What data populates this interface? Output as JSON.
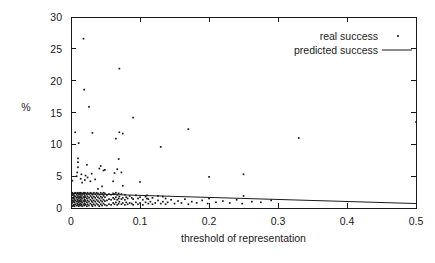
{
  "chart_data": {
    "type": "scatter",
    "title": "",
    "xlabel": "threshold of representation",
    "ylabel": "%",
    "xlim": [
      0,
      0.5
    ],
    "ylim": [
      0,
      30
    ],
    "xticks": [
      0,
      0.1,
      0.2,
      0.3,
      0.4,
      0.5
    ],
    "xtick_labels": [
      "0",
      "0.1",
      "0.2",
      "0.3",
      "0.4",
      "0.5"
    ],
    "yticks": [
      0,
      5,
      10,
      15,
      20,
      25,
      30
    ],
    "ytick_labels": [
      "0",
      "5",
      "10",
      "15",
      "20",
      "25",
      "30"
    ],
    "grid": false,
    "legend_position": "top-right",
    "legend": [
      {
        "label": "real success",
        "marker": "dot"
      },
      {
        "label": "predicted success",
        "marker": "line"
      }
    ],
    "series": [
      {
        "name": "real success",
        "type": "scatter",
        "marker": "dot",
        "color": "#1a1a1a",
        "points": [
          [
            0.002,
            0.3
          ],
          [
            0.002,
            0.8
          ],
          [
            0.002,
            1.2
          ],
          [
            0.002,
            1.6
          ],
          [
            0.002,
            2.0
          ],
          [
            0.002,
            2.4
          ],
          [
            0.002,
            4.3
          ],
          [
            0.003,
            0.4
          ],
          [
            0.003,
            1.0
          ],
          [
            0.003,
            1.5
          ],
          [
            0.003,
            2.1
          ],
          [
            0.004,
            0.5
          ],
          [
            0.004,
            1.1
          ],
          [
            0.004,
            1.7
          ],
          [
            0.004,
            2.2
          ],
          [
            0.005,
            0.3
          ],
          [
            0.005,
            0.9
          ],
          [
            0.005,
            1.4
          ],
          [
            0.005,
            1.9
          ],
          [
            0.005,
            2.3
          ],
          [
            0.006,
            0.6
          ],
          [
            0.006,
            1.2
          ],
          [
            0.006,
            1.8
          ],
          [
            0.006,
            2.4
          ],
          [
            0.006,
            11.9
          ],
          [
            0.008,
            0.4
          ],
          [
            0.008,
            1.0
          ],
          [
            0.008,
            1.6
          ],
          [
            0.008,
            2.2
          ],
          [
            0.008,
            5.0
          ],
          [
            0.009,
            0.7
          ],
          [
            0.009,
            1.3
          ],
          [
            0.009,
            1.9
          ],
          [
            0.009,
            2.4
          ],
          [
            0.009,
            5.6
          ],
          [
            0.01,
            0.5
          ],
          [
            0.01,
            1.1
          ],
          [
            0.01,
            1.7
          ],
          [
            0.01,
            2.3
          ],
          [
            0.01,
            6.4
          ],
          [
            0.01,
            7.2
          ],
          [
            0.01,
            7.8
          ],
          [
            0.011,
            0.3
          ],
          [
            0.011,
            0.9
          ],
          [
            0.011,
            1.5
          ],
          [
            0.011,
            2.1
          ],
          [
            0.011,
            10.2
          ],
          [
            0.012,
            0.6
          ],
          [
            0.012,
            1.2
          ],
          [
            0.012,
            1.8
          ],
          [
            0.012,
            2.4
          ],
          [
            0.013,
            0.4
          ],
          [
            0.013,
            1.0
          ],
          [
            0.013,
            1.6
          ],
          [
            0.013,
            2.2
          ],
          [
            0.014,
            0.7
          ],
          [
            0.014,
            1.3
          ],
          [
            0.014,
            1.9
          ],
          [
            0.014,
            2.4
          ],
          [
            0.014,
            4.6
          ],
          [
            0.015,
            0.5
          ],
          [
            0.015,
            1.1
          ],
          [
            0.015,
            1.7
          ],
          [
            0.015,
            2.3
          ],
          [
            0.015,
            5.3
          ],
          [
            0.016,
            0.3
          ],
          [
            0.016,
            0.9
          ],
          [
            0.016,
            1.5
          ],
          [
            0.016,
            2.1
          ],
          [
            0.016,
            4.0
          ],
          [
            0.018,
            0.6
          ],
          [
            0.018,
            1.2
          ],
          [
            0.018,
            1.8
          ],
          [
            0.018,
            2.4
          ],
          [
            0.018,
            26.6
          ],
          [
            0.019,
            0.4
          ],
          [
            0.019,
            1.0
          ],
          [
            0.019,
            1.6
          ],
          [
            0.019,
            2.2
          ],
          [
            0.019,
            18.6
          ],
          [
            0.02,
            0.7
          ],
          [
            0.02,
            1.3
          ],
          [
            0.02,
            1.9
          ],
          [
            0.02,
            2.4
          ],
          [
            0.02,
            4.4
          ],
          [
            0.021,
            0.5
          ],
          [
            0.021,
            1.1
          ],
          [
            0.021,
            1.7
          ],
          [
            0.021,
            2.3
          ],
          [
            0.021,
            5.1
          ],
          [
            0.023,
            0.3
          ],
          [
            0.023,
            0.9
          ],
          [
            0.023,
            1.5
          ],
          [
            0.023,
            2.1
          ],
          [
            0.023,
            6.8
          ],
          [
            0.024,
            0.6
          ],
          [
            0.024,
            1.2
          ],
          [
            0.024,
            1.8
          ],
          [
            0.024,
            2.4
          ],
          [
            0.024,
            4.8
          ],
          [
            0.026,
            0.4
          ],
          [
            0.026,
            1.0
          ],
          [
            0.026,
            1.6
          ],
          [
            0.026,
            2.2
          ],
          [
            0.026,
            15.9
          ],
          [
            0.028,
            0.7
          ],
          [
            0.028,
            1.3
          ],
          [
            0.028,
            1.9
          ],
          [
            0.028,
            2.4
          ],
          [
            0.028,
            4.2
          ],
          [
            0.03,
            0.5
          ],
          [
            0.03,
            1.1
          ],
          [
            0.03,
            1.7
          ],
          [
            0.03,
            2.3
          ],
          [
            0.03,
            5.4
          ],
          [
            0.031,
            0.3
          ],
          [
            0.031,
            0.9
          ],
          [
            0.031,
            1.5
          ],
          [
            0.031,
            2.1
          ],
          [
            0.031,
            11.8
          ],
          [
            0.033,
            0.6
          ],
          [
            0.033,
            1.2
          ],
          [
            0.033,
            1.8
          ],
          [
            0.033,
            2.4
          ],
          [
            0.035,
            0.4
          ],
          [
            0.035,
            1.0
          ],
          [
            0.035,
            1.6
          ],
          [
            0.035,
            2.2
          ],
          [
            0.035,
            4.5
          ],
          [
            0.037,
            0.7
          ],
          [
            0.037,
            1.3
          ],
          [
            0.037,
            1.9
          ],
          [
            0.037,
            2.4
          ],
          [
            0.039,
            0.5
          ],
          [
            0.039,
            1.1
          ],
          [
            0.039,
            1.7
          ],
          [
            0.039,
            2.3
          ],
          [
            0.039,
            3.0
          ],
          [
            0.041,
            0.3
          ],
          [
            0.041,
            0.9
          ],
          [
            0.041,
            1.5
          ],
          [
            0.041,
            2.1
          ],
          [
            0.041,
            6.2
          ],
          [
            0.043,
            0.6
          ],
          [
            0.043,
            1.2
          ],
          [
            0.043,
            1.8
          ],
          [
            0.043,
            2.4
          ],
          [
            0.043,
            6.6
          ],
          [
            0.045,
            0.4
          ],
          [
            0.045,
            1.0
          ],
          [
            0.045,
            1.6
          ],
          [
            0.045,
            2.2
          ],
          [
            0.045,
            3.4
          ],
          [
            0.047,
            0.7
          ],
          [
            0.047,
            1.3
          ],
          [
            0.047,
            1.9
          ],
          [
            0.047,
            2.4
          ],
          [
            0.047,
            5.9
          ],
          [
            0.049,
            0.5
          ],
          [
            0.049,
            1.1
          ],
          [
            0.049,
            1.7
          ],
          [
            0.049,
            2.3
          ],
          [
            0.049,
            6.0
          ],
          [
            0.052,
            0.4
          ],
          [
            0.052,
            1.2
          ],
          [
            0.052,
            2.0
          ],
          [
            0.055,
            0.6
          ],
          [
            0.055,
            1.4
          ],
          [
            0.055,
            2.2
          ],
          [
            0.058,
            0.5
          ],
          [
            0.058,
            1.3
          ],
          [
            0.058,
            2.1
          ],
          [
            0.061,
            0.8
          ],
          [
            0.061,
            1.6
          ],
          [
            0.061,
            2.3
          ],
          [
            0.061,
            4.2
          ],
          [
            0.063,
            0.6
          ],
          [
            0.063,
            1.4
          ],
          [
            0.063,
            2.2
          ],
          [
            0.063,
            5.5
          ],
          [
            0.065,
            0.9
          ],
          [
            0.065,
            1.7
          ],
          [
            0.065,
            2.4
          ],
          [
            0.065,
            10.9
          ],
          [
            0.067,
            0.5
          ],
          [
            0.067,
            1.3
          ],
          [
            0.067,
            2.1
          ],
          [
            0.067,
            6.1
          ],
          [
            0.069,
            0.7
          ],
          [
            0.069,
            1.5
          ],
          [
            0.069,
            2.3
          ],
          [
            0.069,
            7.7
          ],
          [
            0.07,
            1.0
          ],
          [
            0.07,
            1.8
          ],
          [
            0.07,
            21.9
          ],
          [
            0.07,
            11.9
          ],
          [
            0.073,
            0.6
          ],
          [
            0.073,
            1.4
          ],
          [
            0.073,
            2.2
          ],
          [
            0.073,
            5.6
          ],
          [
            0.075,
            0.8
          ],
          [
            0.075,
            1.6
          ],
          [
            0.075,
            3.5
          ],
          [
            0.075,
            11.7
          ],
          [
            0.078,
            0.5
          ],
          [
            0.078,
            1.3
          ],
          [
            0.078,
            2.1
          ],
          [
            0.08,
            0.9
          ],
          [
            0.08,
            1.7
          ],
          [
            0.082,
            0.6
          ],
          [
            0.082,
            1.5
          ],
          [
            0.085,
            0.8
          ],
          [
            0.085,
            1.9
          ],
          [
            0.088,
            0.7
          ],
          [
            0.088,
            1.6
          ],
          [
            0.09,
            0.5
          ],
          [
            0.09,
            1.4
          ],
          [
            0.09,
            14.2
          ],
          [
            0.094,
            0.9
          ],
          [
            0.094,
            2.0
          ],
          [
            0.097,
            0.6
          ],
          [
            0.097,
            1.5
          ],
          [
            0.1,
            0.8
          ],
          [
            0.1,
            1.7
          ],
          [
            0.1,
            4.1
          ],
          [
            0.104,
            0.5
          ],
          [
            0.104,
            1.3
          ],
          [
            0.108,
            0.9
          ],
          [
            0.108,
            1.8
          ],
          [
            0.11,
            1.5
          ],
          [
            0.11,
            2.0
          ],
          [
            0.112,
            0.7
          ],
          [
            0.112,
            1.4
          ],
          [
            0.115,
            1.0
          ],
          [
            0.118,
            0.6
          ],
          [
            0.118,
            1.6
          ],
          [
            0.122,
            0.8
          ],
          [
            0.126,
            1.2
          ],
          [
            0.126,
            1.9
          ],
          [
            0.13,
            0.7
          ],
          [
            0.13,
            9.6
          ],
          [
            0.133,
            1.0
          ],
          [
            0.133,
            1.8
          ],
          [
            0.137,
            0.6
          ],
          [
            0.137,
            1.5
          ],
          [
            0.14,
            0.9
          ],
          [
            0.145,
            1.3
          ],
          [
            0.15,
            0.7
          ],
          [
            0.155,
            1.1
          ],
          [
            0.16,
            0.8
          ],
          [
            0.165,
            1.4
          ],
          [
            0.17,
            0.6
          ],
          [
            0.17,
            12.4
          ],
          [
            0.175,
            1.0
          ],
          [
            0.182,
            0.8
          ],
          [
            0.19,
            1.2
          ],
          [
            0.198,
            0.7
          ],
          [
            0.2,
            1.5
          ],
          [
            0.2,
            4.9
          ],
          [
            0.21,
            0.9
          ],
          [
            0.22,
            1.1
          ],
          [
            0.23,
            0.8
          ],
          [
            0.24,
            1.3
          ],
          [
            0.248,
            0.7
          ],
          [
            0.25,
            1.9
          ],
          [
            0.25,
            5.3
          ],
          [
            0.262,
            1.0
          ],
          [
            0.275,
            0.9
          ],
          [
            0.29,
            1.2
          ],
          [
            0.33,
            11.0
          ],
          [
            0.5,
            13.5
          ]
        ]
      },
      {
        "name": "predicted success",
        "type": "line",
        "color": "#1a1a1a",
        "points": [
          [
            0.0,
            2.3
          ],
          [
            0.5,
            0.7
          ]
        ]
      }
    ]
  }
}
